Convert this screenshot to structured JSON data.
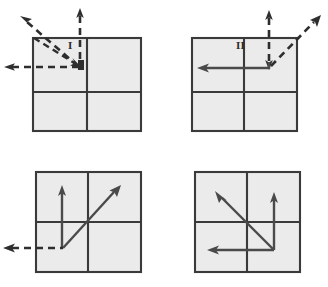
{
  "figure": {
    "type": "vector-quadrant-diagram",
    "background_color": "#ffffff",
    "square_fill_color": "#ebebeb",
    "square_border_color": "#3a3a3a",
    "solid_vector_color": "#4a4a4a",
    "dashed_vector_color": "#2e2e2e",
    "panel_count": 4
  },
  "panels": [
    {
      "id": "panel-1",
      "label": "I",
      "label_position": {
        "x": 68,
        "y": 40
      },
      "square": {
        "x": 32,
        "y": 37,
        "width": 109,
        "height": 94
      },
      "origin_note": "vectors converge at upper-left interior point",
      "vectors": [
        {
          "name": "incoming-up",
          "style": "dashed",
          "direction": "up",
          "head": "up"
        },
        {
          "name": "incoming-left",
          "style": "dashed",
          "direction": "left",
          "head": "left"
        },
        {
          "name": "diagonal-up-left",
          "style": "dashed",
          "direction": "up-left",
          "head": "up-left"
        },
        {
          "name": "diagonal-down-right",
          "style": "dashed",
          "direction": "down-right",
          "head": "down-right"
        }
      ]
    },
    {
      "id": "panel-2",
      "label": "II",
      "label_position": {
        "x": 236,
        "y": 40
      },
      "square": {
        "x": 191,
        "y": 37,
        "width": 106,
        "height": 94
      },
      "origin_note": "vectors meet at top-right interior corner point",
      "vectors": [
        {
          "name": "incoming-up",
          "style": "dashed",
          "direction": "up",
          "head": "up"
        },
        {
          "name": "vertical-down",
          "style": "dashed",
          "direction": "down",
          "head": "down"
        },
        {
          "name": "diagonal-up-right",
          "style": "dashed",
          "direction": "up-right",
          "head": "up-right"
        },
        {
          "name": "resultant-left",
          "style": "solid",
          "direction": "left",
          "head": "left"
        }
      ]
    },
    {
      "id": "panel-3",
      "label": "III",
      "label_position": {
        "x": 41,
        "y": 220
      },
      "square": {
        "x": 35,
        "y": 171,
        "width": 106,
        "height": 101
      },
      "origin_note": "vectors emanate from lower-left interior point",
      "vectors": [
        {
          "name": "resultant-up",
          "style": "solid",
          "direction": "up",
          "head": "up"
        },
        {
          "name": "resultant-diagonal-up-right",
          "style": "solid",
          "direction": "up-right",
          "head": "up-right"
        },
        {
          "name": "incoming-left",
          "style": "dashed",
          "direction": "left",
          "head": "left"
        }
      ]
    },
    {
      "id": "panel-4",
      "label": "IV",
      "label_position": {
        "x": 263,
        "y": 217
      },
      "square": {
        "x": 194,
        "y": 171,
        "width": 106,
        "height": 101
      },
      "origin_note": "vectors emanate from lower-right interior point",
      "vectors": [
        {
          "name": "resultant-up",
          "style": "solid",
          "direction": "up",
          "head": "up"
        },
        {
          "name": "resultant-diagonal-up-left",
          "style": "solid",
          "direction": "up-left",
          "head": "up-left"
        },
        {
          "name": "resultant-left",
          "style": "solid",
          "direction": "left",
          "head": "left"
        }
      ]
    }
  ]
}
